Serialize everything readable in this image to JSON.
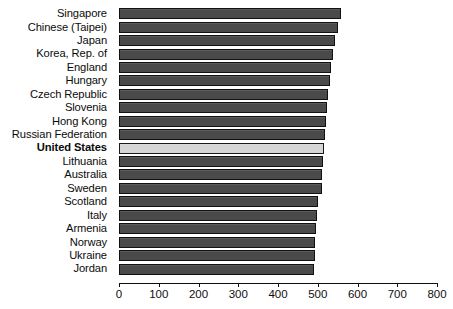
{
  "chart_data": {
    "type": "bar",
    "orientation": "horizontal",
    "title": "",
    "xlabel": "",
    "ylabel": "",
    "xlim": [
      0,
      800
    ],
    "xticks": [
      0,
      100,
      200,
      300,
      400,
      500,
      600,
      700,
      800
    ],
    "grid": false,
    "legend": null,
    "highlight_category": "United States",
    "colors": {
      "bar": "#4a4a4a",
      "bar_border": "#111111",
      "highlight_bar": "#d6d6d6",
      "highlight_border": "#1a1a1a",
      "axis": "#0d0d0d",
      "text": "#0b0b0b",
      "background": "#ffffff"
    },
    "categories": [
      "Singapore",
      "Chinese (Taipei)",
      "Japan",
      "Korea, Rep. of",
      "England",
      "Hungary",
      "Czech Republic",
      "Slovenia",
      "Hong Kong",
      "Russian Federation",
      "United States",
      "Lithuania",
      "Australia",
      "Sweden",
      "Scotland",
      "Italy",
      "Armenia",
      "Norway",
      "Ukraine",
      "Jordan"
    ],
    "values": [
      558,
      552,
      543,
      538,
      533,
      530,
      527,
      523,
      521,
      519,
      515,
      514,
      511,
      511,
      500,
      498,
      496,
      494,
      492,
      490
    ]
  }
}
